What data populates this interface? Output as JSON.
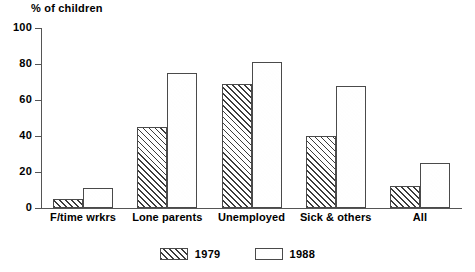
{
  "chart_data": {
    "type": "bar",
    "title": "",
    "subtitle": "",
    "xlabel": "",
    "ylabel": "% of children",
    "ylim": [
      0,
      100
    ],
    "ytick_labels": [
      "100",
      "80",
      "60",
      "40",
      "20",
      "0"
    ],
    "ytick_values": [
      100,
      80,
      60,
      40,
      20,
      0
    ],
    "grid": false,
    "legend_position": "bottom-center",
    "categories": [
      "F/time wrkrs",
      "Lone parents",
      "Unemployed",
      "Sick & others",
      "All"
    ],
    "series": [
      {
        "name": "1979",
        "pattern": "diagonal-hatch",
        "values": [
          5,
          45,
          69,
          40,
          12
        ]
      },
      {
        "name": "1988",
        "pattern": "dotted-stipple",
        "values": [
          11,
          75,
          81,
          68,
          25
        ]
      }
    ]
  },
  "legend": {
    "items": [
      {
        "label": "1979",
        "pattern": "hatch"
      },
      {
        "label": "1988",
        "pattern": "dots"
      }
    ]
  },
  "colors": {
    "background": "#ffffff",
    "axis": "#555555",
    "bar_outline": "#4a4a4a",
    "hatch_line": "#3c3c3c",
    "dot": "#6d6d6d",
    "text": "#000000"
  }
}
